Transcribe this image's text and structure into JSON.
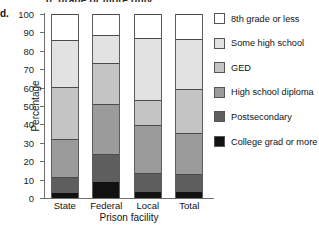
{
  "figure": {
    "part_letter": "d.",
    "cutoff_text_above": "g. grade or more only",
    "ylabel": "Percentage",
    "xlabel": "Prison facility"
  },
  "legend": {
    "position": "right",
    "entries": [
      {
        "label": "8th grade or less",
        "color": "#ffffff",
        "icon": "legend-swatch"
      },
      {
        "label": "Some high school",
        "color": "#e2e2e2",
        "icon": "legend-swatch"
      },
      {
        "label": "GED",
        "color": "#c4c4c4",
        "icon": "legend-swatch"
      },
      {
        "label": "High school diploma",
        "color": "#9b9b9b",
        "icon": "legend-swatch"
      },
      {
        "label": "Postsecondary",
        "color": "#5e5e5e",
        "icon": "legend-swatch"
      },
      {
        "label": "College grad or more",
        "color": "#121212",
        "icon": "legend-swatch"
      }
    ]
  },
  "chart_data": {
    "type": "bar",
    "stacked": true,
    "normalized_percent": true,
    "title": "",
    "xlabel": "Prison facility",
    "ylabel": "Percentage",
    "ylim": [
      0,
      100
    ],
    "ytick_labels": [
      "0",
      "10",
      "20",
      "30",
      "40",
      "50",
      "60",
      "70",
      "80",
      "90",
      "100"
    ],
    "yticks": [
      0,
      10,
      20,
      30,
      40,
      50,
      60,
      70,
      80,
      90,
      100
    ],
    "grid": false,
    "categories": [
      "State",
      "Federal",
      "Local",
      "Total"
    ],
    "series": [
      {
        "name": "College grad or more",
        "color": "#121212",
        "values": [
          2.5,
          8.5,
          3.5,
          3.0
        ]
      },
      {
        "name": "Postsecondary",
        "color": "#5e5e5e",
        "values": [
          9.0,
          15.5,
          10.0,
          10.0
        ]
      },
      {
        "name": "High school diploma",
        "color": "#9b9b9b",
        "values": [
          20.5,
          27.0,
          26.0,
          22.5
        ]
      },
      {
        "name": "GED",
        "color": "#c4c4c4",
        "values": [
          28.5,
          22.5,
          14.0,
          24.0
        ]
      },
      {
        "name": "Some high school",
        "color": "#e2e2e2",
        "values": [
          25.5,
          15.0,
          33.5,
          27.0
        ]
      },
      {
        "name": "8th grade or less",
        "color": "#ffffff",
        "values": [
          14.0,
          11.5,
          13.0,
          13.5
        ]
      }
    ],
    "cumulative_boundaries": {
      "State": [
        2.5,
        11.5,
        32.0,
        60.5,
        86.0,
        100.0
      ],
      "Federal": [
        8.5,
        24.0,
        51.0,
        73.5,
        88.5,
        100.0
      ],
      "Local": [
        3.5,
        13.5,
        39.5,
        53.5,
        87.0,
        100.0
      ],
      "Total": [
        3.0,
        13.0,
        35.5,
        59.5,
        86.5,
        100.0
      ]
    }
  }
}
